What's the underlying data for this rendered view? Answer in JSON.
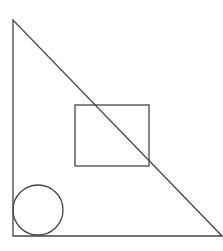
{
  "canvas": {
    "width": 223,
    "height": 251,
    "background": "#ffffff"
  },
  "stroke": {
    "color": "#444444",
    "width": 1.3
  },
  "shapes": {
    "triangle": {
      "points": "13,20 13,236 222,236"
    },
    "rectangle": {
      "x": 75,
      "y": 105,
      "width": 74,
      "height": 61
    },
    "circle": {
      "cx": 38,
      "cy": 210,
      "r": 25
    }
  }
}
